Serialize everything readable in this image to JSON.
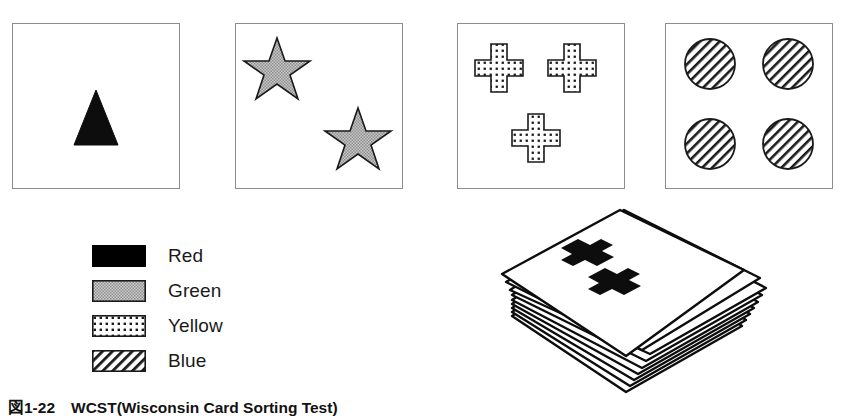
{
  "figure": {
    "caption": "図1-22　WCST(Wisconsin Card Sorting Test)",
    "background_color": "#ffffff",
    "card_border_color": "#8c8c8c",
    "ink_color": "#111111"
  },
  "stimulus_cards": [
    {
      "name": "stimulus-card-1",
      "count": 1,
      "shape": "triangle",
      "color_name": "Red",
      "fill_style": "solid-black",
      "positions": [
        "center"
      ]
    },
    {
      "name": "stimulus-card-2",
      "count": 2,
      "shape": "star",
      "color_name": "Green",
      "fill_style": "gray-stipple",
      "positions": [
        "top-left",
        "bottom-right"
      ]
    },
    {
      "name": "stimulus-card-3",
      "count": 3,
      "shape": "cross",
      "color_name": "Yellow",
      "fill_style": "square-dot-grid",
      "positions": [
        "top-left",
        "top-right",
        "bottom-center"
      ]
    },
    {
      "name": "stimulus-card-4",
      "count": 4,
      "shape": "circle",
      "color_name": "Blue",
      "fill_style": "diagonal-hatch",
      "positions": [
        "top-left",
        "top-right",
        "bottom-left",
        "bottom-right"
      ]
    }
  ],
  "legend": {
    "title": "",
    "items": [
      {
        "label": "Red",
        "fill_style": "solid-black",
        "swatch_color": "#000000"
      },
      {
        "label": "Green",
        "fill_style": "gray-stipple",
        "swatch_color": "#b5b5b5"
      },
      {
        "label": "Yellow",
        "fill_style": "square-dot-grid",
        "swatch_color": "#ffffff"
      },
      {
        "label": "Blue",
        "fill_style": "diagonal-hatch",
        "swatch_color": "#ffffff"
      }
    ]
  },
  "response_deck": {
    "label": "",
    "card_count_visible": 8,
    "top_card": {
      "count": 2,
      "shape": "cross",
      "color_name": "Red",
      "fill_style": "solid-black"
    }
  }
}
